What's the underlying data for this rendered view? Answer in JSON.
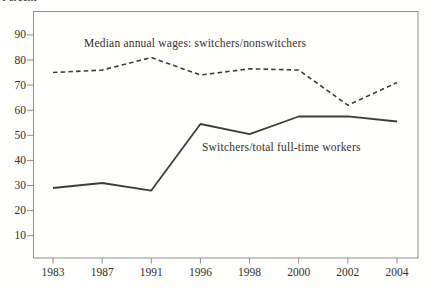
{
  "chart_data": {
    "type": "line",
    "title": "",
    "xlabel": "",
    "ylabel": "Percent",
    "categories": [
      "1983",
      "1987",
      "1991",
      "1996",
      "1998",
      "2000",
      "2002",
      "2004"
    ],
    "yticks": [
      10,
      20,
      30,
      40,
      50,
      60,
      70,
      80,
      90
    ],
    "ylim": [
      0,
      100
    ],
    "grid": false,
    "legend": "inline-annotations",
    "line_color": "#3d3d3d",
    "frame_color": "#8f8f8f",
    "series": [
      {
        "name": "Median annual wages: switchers/nonswitchers",
        "line_style": "dashed",
        "values": [
          75,
          76,
          81,
          74,
          76.5,
          76,
          62,
          71
        ]
      },
      {
        "name": "Switchers/total full-time workers",
        "line_style": "solid",
        "values": [
          29,
          31,
          28,
          54.5,
          50.5,
          57.5,
          57.5,
          55.5
        ]
      }
    ]
  }
}
